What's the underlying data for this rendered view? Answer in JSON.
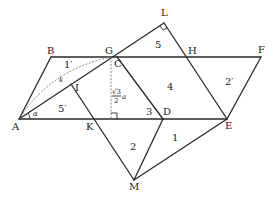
{
  "diagram": {
    "points": {
      "A": {
        "label": "A",
        "x": 19,
        "y": 119
      },
      "B": {
        "label": "B",
        "x": 51,
        "y": 57
      },
      "G": {
        "label": "G",
        "x": 111,
        "y": 57
      },
      "C": {
        "label": "C",
        "x": 117,
        "y": 57
      },
      "H": {
        "label": "H",
        "x": 185,
        "y": 57
      },
      "F": {
        "label": "F",
        "x": 261,
        "y": 57
      },
      "L": {
        "label": "L",
        "x": 164,
        "y": 23
      },
      "I": {
        "label": "I",
        "x": 71,
        "y": 84
      },
      "K": {
        "label": "K",
        "x": 92,
        "y": 119
      },
      "D": {
        "label": "D",
        "x": 163,
        "y": 119
      },
      "E": {
        "label": "E",
        "x": 227,
        "y": 119
      },
      "M": {
        "label": "M",
        "x": 134,
        "y": 180
      }
    },
    "region_labels": {
      "r1p": "1′",
      "r5p": "5′",
      "r5": "5",
      "r4": "4",
      "r3": "3",
      "r2p": "2′",
      "r2": "2",
      "r1": "1"
    },
    "annotations": {
      "k": "k",
      "alpha": "α",
      "height_num": "√3",
      "height_den": "2",
      "height_var": "a"
    }
  }
}
